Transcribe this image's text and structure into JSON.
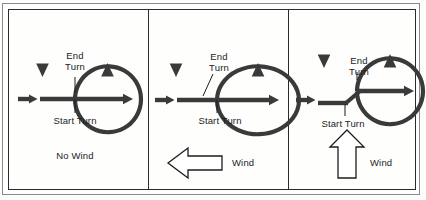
{
  "figure": {
    "panel_count": 3,
    "background_color": "#fefefd",
    "line_color": "#3a3a3a",
    "border_color": "#2b2b2b",
    "text_color": "#1c1c1c"
  },
  "labels": {
    "end_turn_line1": "End",
    "end_turn_line2": "Turn",
    "start_turn": "Start Turn",
    "wind": "Wind"
  },
  "panels": [
    {
      "id": "panel-no-wind",
      "condition_label": "No Wind",
      "end_turn_label_line1": "End",
      "end_turn_label_line2": "Turn",
      "start_turn_label": "Start Turn",
      "wind_label": null,
      "wind_direction": "none",
      "track_shape": "circle",
      "has_wind_arrow": false
    },
    {
      "id": "panel-headwind",
      "condition_label": null,
      "end_turn_label_line1": "End",
      "end_turn_label_line2": "Turn",
      "start_turn_label": "Start Turn",
      "wind_label": "Wind",
      "wind_direction": "left",
      "track_shape": "oval-wide",
      "has_wind_arrow": true
    },
    {
      "id": "panel-crosswind",
      "condition_label": null,
      "end_turn_label_line1": "End",
      "end_turn_label_line2": "Turn",
      "start_turn_label": "Start Turn",
      "wind_label": "Wind",
      "wind_direction": "up",
      "track_shape": "circle-offset",
      "has_wind_arrow": true
    }
  ]
}
